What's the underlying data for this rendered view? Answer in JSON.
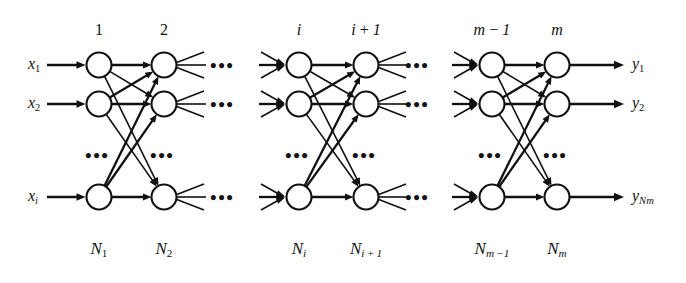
{
  "figure": {
    "type": "neural-network-architecture-diagram",
    "background_color": "#ffffff",
    "ink_color": "#111111"
  },
  "layers": [
    {
      "id": "layer-1",
      "top_label": "1",
      "top_label_style": "upright",
      "bottom_label_base": "N",
      "bottom_label_sub": "1",
      "x": 99
    },
    {
      "id": "layer-2",
      "top_label": "2",
      "top_label_style": "upright",
      "bottom_label_base": "N",
      "bottom_label_sub": "2",
      "x": 164
    },
    {
      "id": "layer-i",
      "top_label": "i",
      "top_label_style": "italic",
      "bottom_label_base": "N",
      "bottom_label_sub": "i",
      "x": 299
    },
    {
      "id": "layer-i1",
      "top_label": "i+1",
      "top_label_style": "italic",
      "bottom_label_base": "N",
      "bottom_label_sub": "i+1",
      "x": 366
    },
    {
      "id": "layer-m1",
      "top_label": "m-1",
      "top_label_style": "italic",
      "bottom_label_base": "N",
      "bottom_label_sub": "m-1",
      "x": 492
    },
    {
      "id": "layer-m",
      "top_label": "m",
      "top_label_style": "italic",
      "bottom_label_base": "N",
      "bottom_label_sub": "m",
      "x": 557
    }
  ],
  "rows": [
    {
      "id": "row-1",
      "y": 65
    },
    {
      "id": "row-2",
      "y": 104
    },
    {
      "id": "row-n",
      "y": 197
    }
  ],
  "vertical_ellipsis_y": 155,
  "inputs": [
    {
      "base": "x",
      "sub": "1",
      "sub_italic": false,
      "y": 65,
      "x": 28
    },
    {
      "base": "x",
      "sub": "2",
      "sub_italic": false,
      "y": 104,
      "x": 28
    },
    {
      "base": "x",
      "sub": "i",
      "sub_italic": true,
      "y": 197,
      "x": 28
    }
  ],
  "outputs": [
    {
      "base": "y",
      "sub": "1",
      "sub_italic": false,
      "y": 65,
      "x": 632
    },
    {
      "base": "y",
      "sub": "2",
      "sub_italic": false,
      "y": 104,
      "x": 632
    },
    {
      "base": "y",
      "sub": "Nm",
      "sub_italic": true,
      "y": 197,
      "x": 632
    }
  ],
  "horizontal_ellipses": [
    {
      "id": "h-ellipsis-a-row1",
      "x": 224,
      "y": 65
    },
    {
      "id": "h-ellipsis-a-row2",
      "x": 224,
      "y": 104
    },
    {
      "id": "h-ellipsis-a-rown",
      "x": 224,
      "y": 197
    },
    {
      "id": "h-ellipsis-b-row1",
      "x": 419,
      "y": 65
    },
    {
      "id": "h-ellipsis-b-row2",
      "x": 419,
      "y": 104
    },
    {
      "id": "h-ellipsis-b-rown",
      "x": 419,
      "y": 197
    }
  ],
  "vertical_ellipses": [
    {
      "id": "v-ellipsis-layer-1",
      "x": 99
    },
    {
      "id": "v-ellipsis-layer-2",
      "x": 164
    },
    {
      "id": "v-ellipsis-layer-i",
      "x": 299
    },
    {
      "id": "v-ellipsis-layer-i1",
      "x": 366
    },
    {
      "id": "v-ellipsis-layer-m1",
      "x": 492
    },
    {
      "id": "v-ellipsis-layer-m",
      "x": 557
    }
  ],
  "glyphs": {
    "ellipsis": "•••",
    "minus": "−",
    "plus": "+"
  }
}
